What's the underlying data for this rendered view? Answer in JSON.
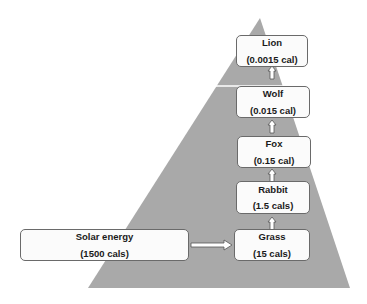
{
  "diagram": {
    "type": "energy-pyramid",
    "colors": {
      "pyramid": "#a9a9a9",
      "box_fill": "#fbfbfb",
      "box_border": "#6a6a6a"
    },
    "source": {
      "name": "Solar energy",
      "value": "(1500 cals)"
    },
    "levels": [
      {
        "name": "Grass",
        "value": "(15 cals)"
      },
      {
        "name": "Rabbit",
        "value": "(1.5 cals)"
      },
      {
        "name": "Fox",
        "value": "(0.15 cal)"
      },
      {
        "name": "Wolf",
        "value": "(0.015 cal)"
      },
      {
        "name": "Lion",
        "value": "(0.0015 cal)"
      }
    ]
  }
}
